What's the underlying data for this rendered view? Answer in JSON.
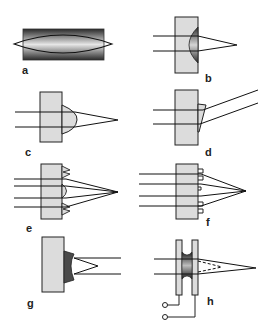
{
  "figure": {
    "panels": [
      {
        "id": "a",
        "label": "a",
        "description": "Gradient-index rod lens with converging rays inside"
      },
      {
        "id": "b",
        "label": "b",
        "description": "Substrate with embedded graded plano-convex lens focusing two rays"
      },
      {
        "id": "c",
        "label": "c",
        "description": "Substrate with refractive convex microlens on surface focusing rays"
      },
      {
        "id": "d",
        "label": "d",
        "description": "Substrate with surface microprism deflecting rays"
      },
      {
        "id": "e",
        "label": "e",
        "description": "Hybrid refractive/diffractive (Fresnel-type) surface lens focusing four rays"
      },
      {
        "id": "f",
        "label": "f",
        "description": "Binary (stepped) diffractive surface lens focusing four rays"
      },
      {
        "id": "g",
        "label": "g",
        "description": "Substrate with concave (diverging) surface lens"
      },
      {
        "id": "h",
        "label": "h",
        "description": "Electrically tunable liquid-crystal lens between two plates with electrodes, variable focus"
      }
    ],
    "colors": {
      "substrate_fill": "#d8d8d8",
      "outline": "#222222",
      "lens_dark": "#3a3a3a",
      "lens_light": "#cfcfcf",
      "background": "#ffffff"
    }
  }
}
